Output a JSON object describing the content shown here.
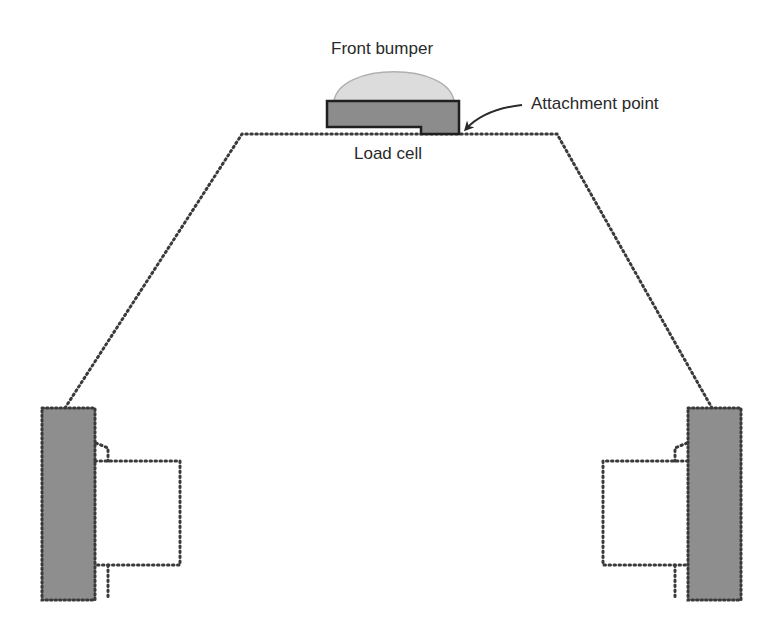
{
  "diagram": {
    "labels": {
      "front_bumper": "Front bumper",
      "attachment_point": "Attachment point",
      "load_cell": "Load cell"
    },
    "colors": {
      "bumper_dome": "#dcdcdc",
      "load_cell_fill": "#8c8c8c",
      "wheel_fill": "#8e8e8e",
      "outline": "#2a2a2a",
      "dotted_line": "#3a3a3a",
      "text": "#2a2a2a"
    },
    "components": [
      "front-bumper",
      "load-cell",
      "attachment-point",
      "chassis-outline",
      "left-wheel",
      "right-wheel",
      "left-motor",
      "right-motor"
    ]
  }
}
